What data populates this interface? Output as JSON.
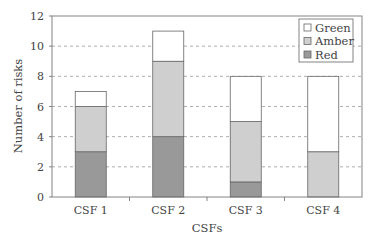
{
  "chart_data": {
    "type": "bar",
    "stacked": true,
    "title": "",
    "xlabel": "CSFs",
    "ylabel": "Number of risks",
    "categories": [
      "CSF 1",
      "CSF 2",
      "CSF 3",
      "CSF 4"
    ],
    "series": [
      {
        "name": "Red",
        "values": [
          3,
          4,
          1,
          0
        ],
        "color": "#999999"
      },
      {
        "name": "Amber",
        "values": [
          3,
          5,
          4,
          3
        ],
        "color": "#cfcfcf"
      },
      {
        "name": "Green",
        "values": [
          1,
          2,
          3,
          5
        ],
        "color": "#ffffff"
      }
    ],
    "ylim": [
      0,
      12
    ],
    "yticks": [
      0,
      2,
      4,
      6,
      8,
      10,
      12
    ],
    "grid": "horizontal dashed",
    "legend_position": "top-right inside",
    "legend_order": [
      "Green",
      "Amber",
      "Red"
    ]
  }
}
